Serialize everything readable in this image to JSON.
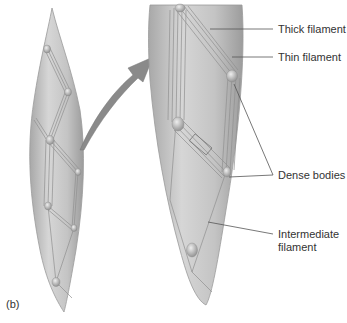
{
  "figure": {
    "panel_label": "(b)",
    "labels": {
      "thick_filament": "Thick filament",
      "thin_filament": "Thin filament",
      "dense_bodies": "Dense bodies",
      "intermediate_filament_line1": "Intermediate",
      "intermediate_filament_line2": "filament"
    },
    "colors": {
      "cell_fill": "#c8c8c8",
      "cell_edge": "#9a9a9a",
      "arrow": "#8a8a8a",
      "leader": "#555555",
      "text": "#333333"
    }
  }
}
